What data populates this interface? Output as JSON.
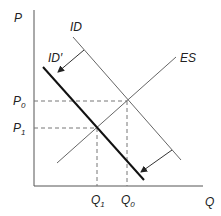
{
  "diagram": {
    "axes": {
      "y_label": "P",
      "x_label": "Q"
    },
    "curves": {
      "id": {
        "label": "ID"
      },
      "id_prime": {
        "label": "ID′"
      },
      "es": {
        "label": "ES"
      }
    },
    "price_ticks": [
      {
        "base": "P",
        "sub": "0"
      },
      {
        "base": "P",
        "sub": "1"
      }
    ],
    "quantity_ticks": [
      {
        "base": "Q",
        "sub": "1"
      },
      {
        "base": "Q",
        "sub": "0"
      }
    ],
    "colors": {
      "axis": "#555555",
      "thin_line": "#666666",
      "thick_line": "#111111",
      "dashed": "#777777",
      "text": "#222222"
    }
  }
}
